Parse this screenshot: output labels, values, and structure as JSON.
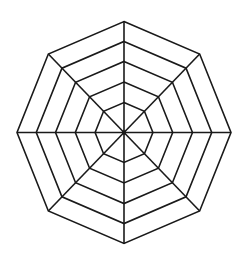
{
  "diagram": {
    "type": "radar-grid",
    "shape": "octagon",
    "sides": 8,
    "rings": 5,
    "spokes": 8,
    "center": {
      "x": 124,
      "y": 132.5
    },
    "radius_x": 107,
    "radius_y": 111,
    "ring_fractions": [
      0.27,
      0.455,
      0.64,
      0.82,
      1.0
    ],
    "stroke_color": "#1a1a1a",
    "stroke_width": 1.6,
    "background": "#ffffff",
    "labels": []
  }
}
